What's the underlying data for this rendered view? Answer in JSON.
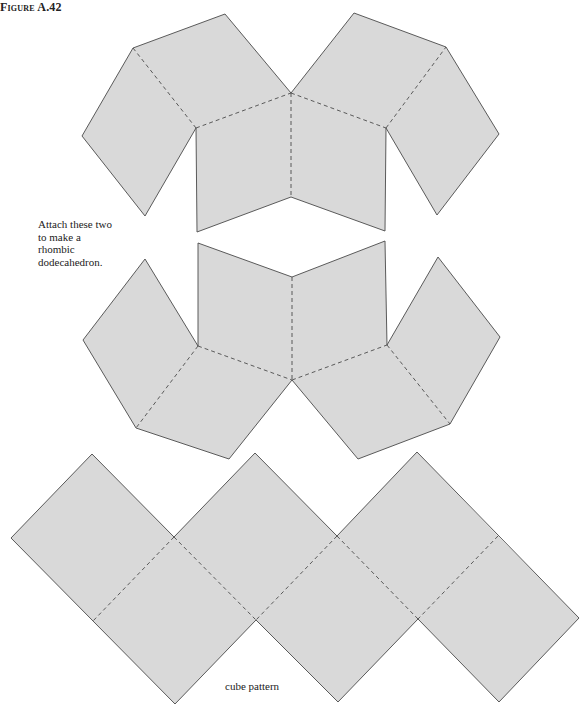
{
  "figure": {
    "label": "Figure A.42",
    "instructions_lines": [
      "Attach these two",
      "to make a",
      "rhombic",
      "dodecahedron."
    ],
    "cube_label": "cube pattern"
  },
  "colors": {
    "face_fill": "#d9d9d9",
    "edge_stroke": "#4a4a4a",
    "background": "#ffffff"
  },
  "nets": {
    "rhombic_dodecahedron_top": {
      "faces": [
        "82,136 133,48 196,128 145,216",
        "133,48 225,14 291,93 196,128",
        "196,128 291,93 291,197 197,232",
        "291,93 386,128 385,231 291,197",
        "291,93 354,13 446,47 386,128",
        "386,128 446,47 499,134 437,215"
      ],
      "outline": "82,136 133,48 225,14 291,93 354,13 446,47 499,134 437,215 386,128 385,231 291,197 197,232 196,128 145,216 82,136",
      "folds": [
        "133,48 196,128",
        "196,128 291,93",
        "291,93 291,197",
        "291,93 386,128",
        "386,128 446,47"
      ]
    },
    "rhombic_dodecahedron_bottom": {
      "faces": [
        "198,243 292,277 292,380 198,346",
        "292,277 385,241 387,345 292,380",
        "145,259 198,346 136,428 83,340",
        "198,346 292,380 229,459 136,428",
        "292,380 387,345 450,424 358,459",
        "387,345 438,257 500,337 450,424"
      ],
      "outline": "198,243 292,277 385,241 387,345 438,257 500,337 450,424 358,459 292,380 229,459 136,428 83,340 145,259 198,346 198,243",
      "folds": [
        "292,277 292,380",
        "198,346 292,380",
        "292,380 387,345",
        "198,346 136,428",
        "387,345 450,424"
      ]
    },
    "cube": {
      "faces": [
        "92,454 174,537 93,621 11,538",
        "174,537 256,620 175,704 93,621",
        "255,453 337,536 256,620 174,537",
        "337,536 418,619 338,702 256,620",
        "417,452 498,536 418,619 337,536",
        "498,536 579,618 499,702 418,619"
      ],
      "outline": "92,454 174,537 255,453 337,536 417,452 579,618 499,702 418,619 338,702 256,620 175,704 11,538 92,454",
      "folds": [
        "174,537 93,621",
        "174,537 256,620",
        "337,536 256,620",
        "337,536 418,619",
        "498,536 418,619"
      ]
    }
  }
}
